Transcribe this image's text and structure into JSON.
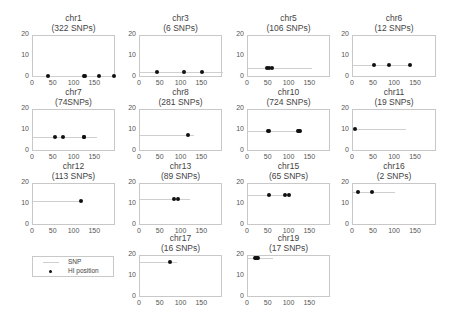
{
  "chart_data": {
    "type": "scatter",
    "layout": "small-multiples 4 columns",
    "x_ticks": [
      0,
      50,
      100,
      150
    ],
    "y_ticks": [
      0,
      10,
      20
    ],
    "xlim": [
      0,
      200
    ],
    "ylim": [
      0,
      20
    ],
    "grid": false,
    "legend": {
      "position": "bottom-left panel",
      "entries": [
        {
          "label": "SNP",
          "style": "line",
          "color": "#cfcfcf"
        },
        {
          "label": "HI position",
          "style": "marker",
          "color": "#111111"
        }
      ]
    },
    "panels": [
      {
        "chr": "chr1",
        "snps": "(322 SNPs)",
        "line_y": 1,
        "line_x": [
          0,
          195
        ],
        "points": [
          35,
          122,
          125,
          160,
          195
        ]
      },
      {
        "chr": "chr3",
        "snps": "(6 SNPs)",
        "line_y": 3,
        "line_x": [
          0,
          200
        ],
        "points": [
          40,
          105,
          150
        ]
      },
      {
        "chr": "chr5",
        "snps": "(106 SNPs)",
        "line_y": 5,
        "line_x": [
          0,
          155
        ],
        "points": [
          45,
          50,
          58
        ]
      },
      {
        "chr": "chr6",
        "snps": "(12 SNPs)",
        "line_y": 6,
        "line_x": [
          0,
          140
        ],
        "points": [
          50,
          85,
          135
        ]
      },
      {
        "chr": "chr7",
        "snps": "(74SNPs)",
        "line_y": 7,
        "line_x": [
          0,
          155
        ],
        "points": [
          52,
          73,
          122,
          124
        ]
      },
      {
        "chr": "chr8",
        "snps": "(281 SNPs)",
        "line_y": 8,
        "line_x": [
          0,
          130
        ],
        "points": [
          116
        ]
      },
      {
        "chr": "chr10",
        "snps": "(724 SNPs)",
        "line_y": 10,
        "line_x": [
          0,
          130
        ],
        "points": [
          48,
          50,
          120,
          122,
          125
        ]
      },
      {
        "chr": "chr11",
        "snps": "(19 SNPs)",
        "line_y": 11,
        "line_x": [
          0,
          125
        ],
        "points": [
          4
        ]
      },
      {
        "chr": "chr12",
        "snps": "(113 SNPs)",
        "line_y": 12,
        "line_x": [
          0,
          115
        ],
        "points": [
          115
        ]
      },
      {
        "chr": "chr13",
        "snps": "(89 SNPs)",
        "line_y": 13,
        "line_x": [
          0,
          120
        ],
        "points": [
          82,
          92
        ]
      },
      {
        "chr": "chr15",
        "snps": "(65 SNPs)",
        "line_y": 15,
        "line_x": [
          0,
          100
        ],
        "points": [
          50,
          88,
          98
        ]
      },
      {
        "chr": "chr16",
        "snps": "(2 SNPs)",
        "line_y": 16,
        "line_x": [
          0,
          100
        ],
        "points": [
          12,
          45
        ]
      },
      {
        "chr": "chr17",
        "snps": "(16 SNPs)",
        "line_y": 17,
        "line_x": [
          0,
          90
        ],
        "points": [
          73
        ]
      },
      {
        "chr": "chr19",
        "snps": "(17 SNPs)",
        "line_y": 19,
        "line_x": [
          0,
          60
        ],
        "points": [
          16,
          19,
          22,
          24
        ]
      }
    ]
  },
  "legend": {
    "snp_label": "SNP",
    "hi_label": "HI position"
  }
}
